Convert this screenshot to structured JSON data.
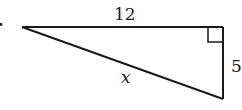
{
  "problem": {
    "number_suffix": "."
  },
  "triangle": {
    "type": "right-triangle",
    "side_top_label": "12",
    "side_right_label": "5",
    "hypotenuse_label": "x",
    "right_angle_marker": "top-right",
    "stroke_color": "#1a1a1a"
  }
}
